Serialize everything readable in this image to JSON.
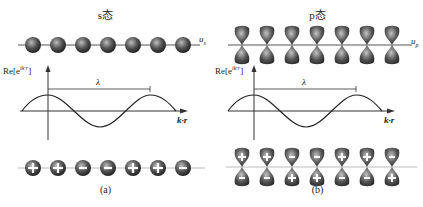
{
  "panels": [
    {
      "id": "a",
      "title": "s态",
      "mode_label": "u",
      "mode_sub": "s",
      "y_axis_label": "Re[e^{ik·r}]",
      "y_axis_base": "Re[e",
      "y_axis_exp": "ik·r",
      "y_axis_close": "]",
      "wavelength_label": "λ",
      "x_axis_label": "k·r",
      "caption": "(a)",
      "orbital_type": "s",
      "atom_count": 7,
      "phase_signs": [
        "+",
        "+",
        "-",
        "-",
        "+",
        "+",
        "-"
      ]
    },
    {
      "id": "b",
      "title": "p态",
      "mode_label": "u",
      "mode_sub": "p",
      "y_axis_label": "Re[e^{ik·r}]",
      "y_axis_base": "Re[e",
      "y_axis_exp": "ik·r",
      "y_axis_close": "]",
      "wavelength_label": "λ",
      "x_axis_label": "k·r",
      "caption": "(b)",
      "orbital_type": "p",
      "atom_count": 7,
      "phase_signs_top": [
        "+",
        "+",
        "-",
        "-",
        "+",
        "+",
        "-"
      ],
      "phase_signs_bottom": [
        "-",
        "-",
        "+",
        "+",
        "-",
        "-",
        "+"
      ]
    }
  ],
  "colors": {
    "atom_dark": "#3a3a3a",
    "atom_light": "#b8b8b8",
    "line": "#444444",
    "axis": "#333333"
  }
}
